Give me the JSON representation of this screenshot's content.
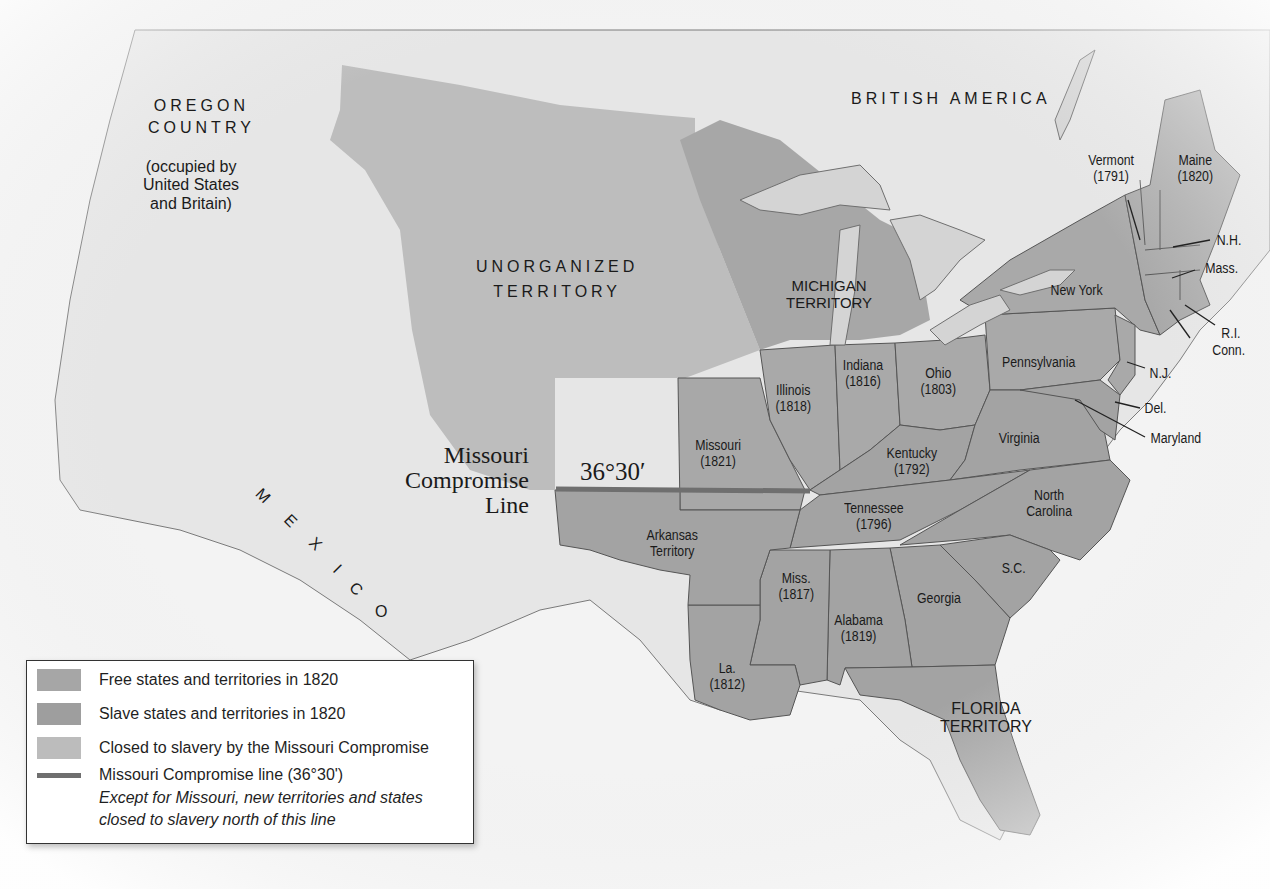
{
  "map": {
    "regions": {
      "oregon": {
        "line1": "OREGON",
        "line2": "COUNTRY",
        "line3": "(occupied by",
        "line4": "United States",
        "line5": "and Britain)"
      },
      "british_america": "BRITISH AMERICA",
      "unorganized": {
        "line1": "UNORGANIZED",
        "line2": "TERRITORY"
      },
      "michigan": {
        "line1": "MICHIGAN",
        "line2": "TERRITORY"
      },
      "florida": {
        "line1": "FLORIDA",
        "line2": "TERRITORY"
      },
      "mexico": [
        "M",
        "E",
        "X",
        "I",
        "C",
        "O"
      ],
      "arkansas": {
        "line1": "Arkansas",
        "line2": "Territory"
      }
    },
    "states": {
      "vermont": {
        "name": "Vermont",
        "year": "(1791)"
      },
      "maine": {
        "name": "Maine",
        "year": "(1820)"
      },
      "nh": "N.H.",
      "mass": "Mass.",
      "ri": "R.I.",
      "conn": "Conn.",
      "new_york": "New York",
      "pennsylvania": "Pennsylvania",
      "nj": "N.J.",
      "del": "Del.",
      "maryland": "Maryland",
      "virginia": "Virginia",
      "north_carolina": {
        "line1": "North",
        "line2": "Carolina"
      },
      "sc": "S.C.",
      "georgia": "Georgia",
      "alabama": {
        "name": "Alabama",
        "year": "(1819)"
      },
      "mississippi": {
        "name": "Miss.",
        "year": "(1817)"
      },
      "louisiana": {
        "name": "La.",
        "year": "(1812)"
      },
      "tennessee": {
        "name": "Tennessee",
        "year": "(1796)"
      },
      "kentucky": {
        "name": "Kentucky",
        "year": "(1792)"
      },
      "ohio": {
        "name": "Ohio",
        "year": "(1803)"
      },
      "indiana": {
        "name": "Indiana",
        "year": "(1816)"
      },
      "illinois": {
        "name": "Illinois",
        "year": "(1818)"
      },
      "missouri": {
        "name": "Missouri",
        "year": "(1821)"
      }
    },
    "compromise_line": {
      "title_line1": "Missouri",
      "title_line2": "Compromise",
      "title_line3": "Line",
      "latitude": "36°30′"
    },
    "colors": {
      "background": "#f3f3f3",
      "free": "#a9a9a9",
      "slave": "#a3a3a3",
      "closed": "#bdbdbd",
      "water": "#d4d4d4",
      "compromise_line": "#6f6f6f",
      "border": "#555555"
    }
  },
  "legend": {
    "items": [
      {
        "label": "Free states and territories in 1820",
        "color": "#a6a6a6"
      },
      {
        "label": "Slave states and territories in 1820",
        "color": "#9e9e9e"
      },
      {
        "label": "Closed to slavery by the Missouri Compromise",
        "color": "#bcbcbc"
      },
      {
        "label": "Missouri Compromise line (36°30')",
        "color": "#6f6f6f"
      }
    ],
    "note_line1": "Except for Missouri, new territories and states",
    "note_line2": "closed to slavery north of this line"
  }
}
